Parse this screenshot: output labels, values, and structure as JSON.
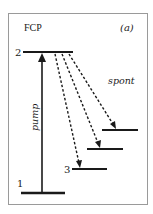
{
  "diagram": {
    "title": "FCP",
    "panel_label": "(a)",
    "frame_color": "#9a9a9a",
    "line_color": "#1a1a1a",
    "levels": [
      {
        "id": "level-1",
        "label": "1",
        "x1": 21,
        "x2": 65,
        "y": 193
      },
      {
        "id": "level-2",
        "label": "2",
        "x1": 23,
        "x2": 73,
        "y": 52
      },
      {
        "id": "level-3",
        "label": "3",
        "x1": 72,
        "x2": 107,
        "y": 169
      },
      {
        "id": "level-4",
        "label": "",
        "x1": 87,
        "x2": 123,
        "y": 149
      },
      {
        "id": "level-5",
        "label": "",
        "x1": 102,
        "x2": 138,
        "y": 130
      }
    ],
    "transitions": [
      {
        "type": "pump",
        "label": "pump",
        "from": "level-1",
        "to": "level-2",
        "style": "solid"
      },
      {
        "type": "spont",
        "label": "spont",
        "from": "level-2",
        "to": "level-3",
        "style": "dashed"
      },
      {
        "type": "spont",
        "label": "spont",
        "from": "level-2",
        "to": "level-4",
        "style": "dashed"
      },
      {
        "type": "spont",
        "label": "spont",
        "from": "level-2",
        "to": "level-5",
        "style": "dashed"
      }
    ],
    "labels": {
      "pump": "pump",
      "spont": "spont",
      "level_1": "1",
      "level_2": "2",
      "level_3": "3"
    }
  }
}
